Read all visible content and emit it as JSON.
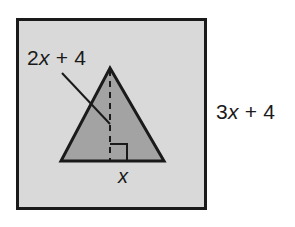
{
  "figure": {
    "colors": {
      "page_background": "#ffffff",
      "square_fill": "#d9d9d9",
      "square_stroke": "#1a1a1a",
      "triangle_fill": "#a3a3a3",
      "triangle_stroke": "#1a1a1a",
      "label_text": "#1a1a1a"
    },
    "square": {
      "name": "outer-square",
      "x": 16,
      "y": 18,
      "width": 191,
      "height": 192,
      "stroke_width": 3
    },
    "triangle": {
      "name": "shaded-triangle",
      "apex": {
        "x": 110,
        "y": 68
      },
      "base_left": {
        "x": 61,
        "y": 161
      },
      "base_right": {
        "x": 164,
        "y": 161
      },
      "stroke_width": 3
    },
    "altitude": {
      "name": "altitude-dashed-line",
      "from": {
        "x": 110,
        "y": 68
      },
      "to": {
        "x": 110,
        "y": 161
      },
      "dash": "6 5",
      "stroke_width": 2
    },
    "right_angle_marker": {
      "name": "right-angle-marker",
      "x": 110,
      "y": 161,
      "size": 17,
      "stroke_width": 2
    },
    "leader_line": {
      "name": "leader-line",
      "from": {
        "x": 62,
        "y": 73
      },
      "to": {
        "x": 110,
        "y": 124
      },
      "stroke_width": 2
    },
    "labels": {
      "hypotenuse": {
        "prefix": "2",
        "variable": "x",
        "suffix": " + 4",
        "full_text": "2x + 4"
      },
      "square_side": {
        "prefix": "3",
        "variable": "x",
        "suffix": " + 4",
        "full_text": "3x + 4"
      },
      "base": {
        "prefix": "",
        "variable": "x",
        "suffix": "",
        "full_text": "x"
      }
    }
  }
}
